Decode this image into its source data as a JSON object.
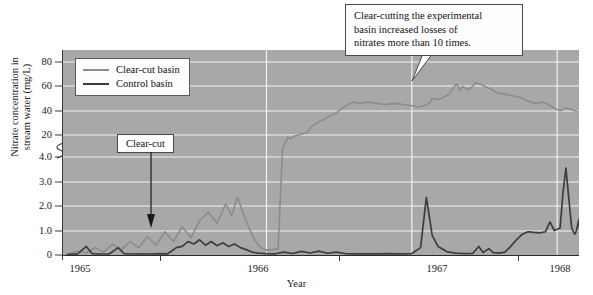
{
  "chart_data": {
    "type": "line",
    "title": "",
    "xlabel": "Year",
    "ylabel": "Nitrate concentration in stream water (mg/L)",
    "ylabel_line1": "Nitrate concentration in",
    "ylabel_line2": "stream water (mg/L)",
    "x_tick_labels": [
      "1965",
      "1966",
      "1967",
      "1968"
    ],
    "y_tick_labels": [
      "0",
      "1.0",
      "2.0",
      "3.0",
      "4.0",
      "20",
      "40",
      "60",
      "80"
    ],
    "y_axis_break": true,
    "y_axis_break_note": "axis break between 4.0 and 20",
    "xlim": [
      1964.6,
      1968.15
    ],
    "ylim_lower": [
      0,
      4
    ],
    "ylim_upper": [
      4,
      88
    ],
    "grid": true,
    "legend_position": "upper-left-inside",
    "series": [
      {
        "name": "Clear-cut basin",
        "color": "#8c8c8c",
        "points": [
          [
            1964.63,
            0.05
          ],
          [
            1964.7,
            0.15
          ],
          [
            1964.76,
            0.08
          ],
          [
            1964.82,
            0.3
          ],
          [
            1964.88,
            0.12
          ],
          [
            1964.94,
            0.45
          ],
          [
            1965.0,
            0.2
          ],
          [
            1965.06,
            0.55
          ],
          [
            1965.12,
            0.3
          ],
          [
            1965.18,
            0.75
          ],
          [
            1965.24,
            0.4
          ],
          [
            1965.3,
            0.95
          ],
          [
            1965.36,
            0.55
          ],
          [
            1965.42,
            1.15
          ],
          [
            1965.48,
            0.7
          ],
          [
            1965.54,
            1.4
          ],
          [
            1965.6,
            1.75
          ],
          [
            1965.66,
            1.3
          ],
          [
            1965.72,
            2.1
          ],
          [
            1965.76,
            1.6
          ],
          [
            1965.8,
            2.35
          ],
          [
            1965.84,
            1.7
          ],
          [
            1965.88,
            1.1
          ],
          [
            1965.92,
            0.6
          ],
          [
            1965.96,
            0.3
          ],
          [
            1966.0,
            0.2
          ],
          [
            1966.04,
            0.22
          ],
          [
            1966.08,
            0.25
          ],
          [
            1966.11,
            8
          ],
          [
            1966.13,
            14
          ],
          [
            1966.15,
            18
          ],
          [
            1966.17,
            17
          ],
          [
            1966.19,
            19
          ],
          [
            1966.22,
            20
          ],
          [
            1966.25,
            21
          ],
          [
            1966.28,
            22
          ],
          [
            1966.32,
            28
          ],
          [
            1966.36,
            31
          ],
          [
            1966.4,
            33
          ],
          [
            1966.44,
            36
          ],
          [
            1966.48,
            38
          ],
          [
            1966.52,
            42
          ],
          [
            1966.56,
            45
          ],
          [
            1966.6,
            47
          ],
          [
            1966.64,
            46
          ],
          [
            1966.7,
            47
          ],
          [
            1966.76,
            46
          ],
          [
            1966.82,
            45
          ],
          [
            1966.88,
            46
          ],
          [
            1966.94,
            45
          ],
          [
            1967.0,
            44
          ],
          [
            1967.04,
            43
          ],
          [
            1967.08,
            44
          ],
          [
            1967.12,
            46
          ],
          [
            1967.14,
            50
          ],
          [
            1967.18,
            49
          ],
          [
            1967.22,
            51
          ],
          [
            1967.26,
            54
          ],
          [
            1967.28,
            58
          ],
          [
            1967.31,
            62
          ],
          [
            1967.33,
            57
          ],
          [
            1967.35,
            60
          ],
          [
            1967.38,
            57
          ],
          [
            1967.41,
            59
          ],
          [
            1967.44,
            63
          ],
          [
            1967.47,
            62
          ],
          [
            1967.5,
            60
          ],
          [
            1967.54,
            58
          ],
          [
            1967.58,
            55
          ],
          [
            1967.62,
            54
          ],
          [
            1967.66,
            53
          ],
          [
            1967.7,
            52
          ],
          [
            1967.74,
            51
          ],
          [
            1967.78,
            49
          ],
          [
            1967.82,
            47
          ],
          [
            1967.86,
            46
          ],
          [
            1967.9,
            47
          ],
          [
            1967.94,
            45
          ],
          [
            1967.98,
            42
          ],
          [
            1968.02,
            40
          ],
          [
            1968.06,
            42
          ],
          [
            1968.1,
            41
          ],
          [
            1968.14,
            39
          ]
        ]
      },
      {
        "name": "Control basin",
        "color": "#3d3d3d",
        "points": [
          [
            1964.63,
            0.02
          ],
          [
            1964.7,
            0.05
          ],
          [
            1964.76,
            0.35
          ],
          [
            1964.8,
            0.06
          ],
          [
            1964.86,
            0.04
          ],
          [
            1964.92,
            0.05
          ],
          [
            1964.98,
            0.3
          ],
          [
            1965.02,
            0.06
          ],
          [
            1965.08,
            0.04
          ],
          [
            1965.14,
            0.05
          ],
          [
            1965.2,
            0.04
          ],
          [
            1965.26,
            0.06
          ],
          [
            1965.32,
            0.05
          ],
          [
            1965.38,
            0.3
          ],
          [
            1965.42,
            0.35
          ],
          [
            1965.46,
            0.55
          ],
          [
            1965.5,
            0.45
          ],
          [
            1965.54,
            0.62
          ],
          [
            1965.58,
            0.4
          ],
          [
            1965.62,
            0.55
          ],
          [
            1965.66,
            0.38
          ],
          [
            1965.7,
            0.5
          ],
          [
            1965.74,
            0.35
          ],
          [
            1965.78,
            0.45
          ],
          [
            1965.82,
            0.3
          ],
          [
            1965.86,
            0.22
          ],
          [
            1965.9,
            0.12
          ],
          [
            1965.94,
            0.08
          ],
          [
            1966.0,
            0.06
          ],
          [
            1966.06,
            0.05
          ],
          [
            1966.12,
            0.12
          ],
          [
            1966.18,
            0.06
          ],
          [
            1966.24,
            0.15
          ],
          [
            1966.3,
            0.08
          ],
          [
            1966.36,
            0.16
          ],
          [
            1966.42,
            0.07
          ],
          [
            1966.48,
            0.12
          ],
          [
            1966.54,
            0.06
          ],
          [
            1966.6,
            0.05
          ],
          [
            1966.68,
            0.05
          ],
          [
            1966.76,
            0.05
          ],
          [
            1966.84,
            0.06
          ],
          [
            1966.92,
            0.05
          ],
          [
            1967.0,
            0.06
          ],
          [
            1967.06,
            0.3
          ],
          [
            1967.1,
            2.35
          ],
          [
            1967.14,
            0.8
          ],
          [
            1967.18,
            0.35
          ],
          [
            1967.24,
            0.14
          ],
          [
            1967.3,
            0.08
          ],
          [
            1967.36,
            0.06
          ],
          [
            1967.42,
            0.07
          ],
          [
            1967.46,
            0.35
          ],
          [
            1967.49,
            0.1
          ],
          [
            1967.53,
            0.26
          ],
          [
            1967.56,
            0.1
          ],
          [
            1967.6,
            0.08
          ],
          [
            1967.64,
            0.12
          ],
          [
            1967.68,
            0.35
          ],
          [
            1967.72,
            0.62
          ],
          [
            1967.76,
            0.85
          ],
          [
            1967.8,
            0.95
          ],
          [
            1967.84,
            0.92
          ],
          [
            1967.88,
            0.9
          ],
          [
            1967.92,
            0.95
          ],
          [
            1967.95,
            1.35
          ],
          [
            1967.98,
            1.0
          ],
          [
            1968.0,
            1.05
          ],
          [
            1968.02,
            1.1
          ],
          [
            1968.04,
            2.55
          ],
          [
            1968.06,
            3.55
          ],
          [
            1968.08,
            2.3
          ],
          [
            1968.1,
            1.1
          ],
          [
            1968.12,
            0.85
          ],
          [
            1968.13,
            0.95
          ],
          [
            1968.15,
            1.45
          ],
          [
            1968.16,
            0.55
          ]
        ]
      }
    ],
    "annotations": [
      {
        "name": "clear-cut-event",
        "label": "Clear-cut",
        "arrow": "down"
      },
      {
        "name": "main-callout",
        "line1": "Clear-cutting the experimental",
        "line2": "basin increased losses of",
        "line3": "nitrates more than 10 times."
      }
    ]
  },
  "legend": {
    "items": [
      {
        "label": "Clear-cut basin",
        "color": "#8c8c8c"
      },
      {
        "label": "Control basin",
        "color": "#3d3d3d"
      }
    ]
  },
  "axes": {
    "x_title": "Year",
    "y_title_line1": "Nitrate concentration in",
    "y_title_line2": "stream water (mg/L)",
    "y_ticks": [
      {
        "label": "80",
        "y": 62
      },
      {
        "label": "60",
        "y": 86
      },
      {
        "label": "40",
        "y": 111
      },
      {
        "label": "20",
        "y": 135
      },
      {
        "label": "4.0",
        "y": 157
      },
      {
        "label": "3.0",
        "y": 182
      },
      {
        "label": "2.0",
        "y": 206
      },
      {
        "label": "1.0",
        "y": 231
      },
      {
        "label": "0",
        "y": 255
      }
    ],
    "x_ticks": [
      {
        "label": "1965",
        "x": 80
      },
      {
        "label": "1966",
        "x": 258
      },
      {
        "label": "1967",
        "x": 437
      },
      {
        "label": "1968",
        "x": 560
      }
    ]
  },
  "annotations": {
    "clearcut_label": "Clear-cut",
    "callout_line1": "Clear-cutting the experimental",
    "callout_line2": "basin increased losses of",
    "callout_line3": "nitrates more than 10 times."
  },
  "colors": {
    "plot_background": "#a8a8a8",
    "gridline": "#f2f2f2",
    "clearcut_line": "#8c8c8c",
    "control_line": "#3d3d3d",
    "axis": "#3a3a3a",
    "box_background": "#fdfdfd"
  }
}
